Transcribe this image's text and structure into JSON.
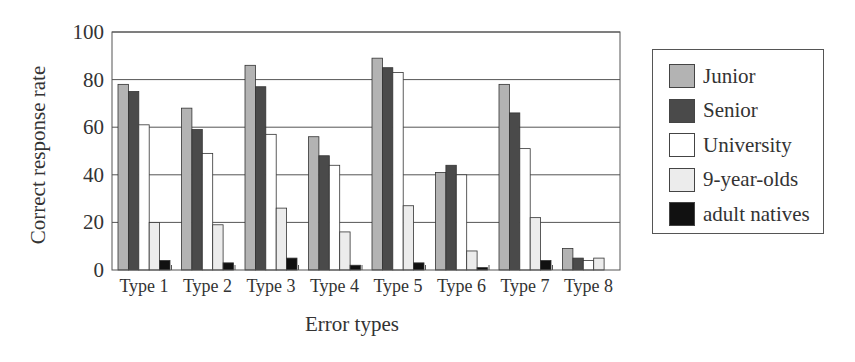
{
  "chart_data": {
    "type": "bar",
    "title": "",
    "xlabel": "Error types",
    "ylabel": "Correct response rate",
    "ylim": [
      0,
      100
    ],
    "yticks": [
      0,
      20,
      40,
      60,
      80,
      100
    ],
    "grid": true,
    "legend_position": "right",
    "categories": [
      "Type 1",
      "Type 2",
      "Type 3",
      "Type 4",
      "Type 5",
      "Type 6",
      "Type 7",
      "Type 8"
    ],
    "series": [
      {
        "name": "Junior",
        "color": "#b3b3b3",
        "values": [
          78,
          68,
          86,
          56,
          89,
          41,
          78,
          9
        ]
      },
      {
        "name": "Senior",
        "color": "#4a4a4a",
        "values": [
          75,
          59,
          77,
          48,
          85,
          44,
          66,
          5
        ]
      },
      {
        "name": "University",
        "color": "#ffffff",
        "values": [
          61,
          49,
          57,
          44,
          83,
          40,
          51,
          4
        ]
      },
      {
        "name": "9-year-olds",
        "color": "#ececec",
        "values": [
          20,
          19,
          26,
          16,
          27,
          8,
          22,
          5
        ]
      },
      {
        "name": "adult natives",
        "color": "#111111",
        "values": [
          4,
          3,
          5,
          2,
          3,
          1,
          4,
          0
        ]
      }
    ]
  }
}
